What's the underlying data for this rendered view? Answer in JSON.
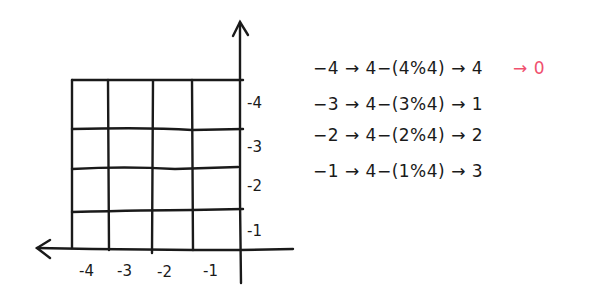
{
  "diagram": {
    "type": "hand-drawn coordinate grid with mapping equations",
    "grid": {
      "columns": 4,
      "rows": 4,
      "x_tick_labels": [
        "-4",
        "-3",
        "-2",
        "-1"
      ],
      "y_tick_labels": [
        "-4",
        "-3",
        "-2",
        "-1"
      ]
    },
    "axes": {
      "x_arrow_direction": "left",
      "y_arrow_direction": "up"
    },
    "equations": [
      {
        "input": "-4",
        "expr": "4-(4%4)",
        "result": "4",
        "extra": "→ 0"
      },
      {
        "input": "-3",
        "expr": "4-(3%4)",
        "result": "1"
      },
      {
        "input": "-2",
        "expr": "4-(2%4)",
        "result": "2"
      },
      {
        "input": "-1",
        "expr": "4-(1%4)",
        "result": "3"
      }
    ],
    "lines": [
      "−4 → 4−(4%4) → 4",
      "−3 → 4−(3%4) → 1",
      "−2 → 4−(2%4) → 2",
      "−1 → 4−(1%4) → 3"
    ],
    "highlight": "→ 0",
    "colors": {
      "ink": "#1a1a1a",
      "highlight": "#f0506e",
      "background": "#ffffff"
    }
  }
}
